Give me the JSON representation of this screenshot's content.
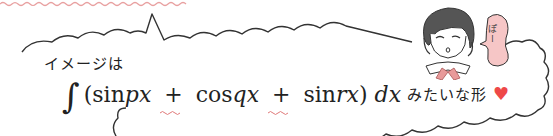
{
  "illustration": {
    "intro_label": "イメージは",
    "formula": {
      "integral_symbol": "∫",
      "open_paren": "(",
      "term1_func": "sin",
      "term1_arg": "px",
      "plus1": "+",
      "term2_func": "cos",
      "term2_arg": "qx",
      "plus2": "+",
      "term3_func": "sin",
      "term3_arg": "rx",
      "close_paren": ")",
      "differential": "dx"
    },
    "suffix_label": "みたいな形",
    "heart_glyph": "♥",
    "character_bubble_text": "ぽー",
    "colors": {
      "outline": "#333333",
      "accent_pink": "#e8a0a0",
      "bubble_fill": "#f6c6c6",
      "heart": "#ee4848",
      "squiggle": "#e07a7a"
    }
  }
}
